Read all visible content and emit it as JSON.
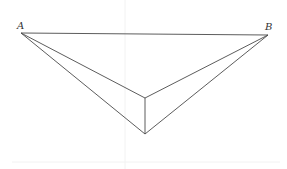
{
  "diagram": {
    "type": "geometry-figure",
    "labels": {
      "A": "A",
      "B": "B"
    },
    "points": [
      "A",
      "B",
      "C",
      "D"
    ],
    "segments": [
      [
        "A",
        "B"
      ],
      [
        "A",
        "C"
      ],
      [
        "A",
        "D"
      ],
      [
        "B",
        "C"
      ],
      [
        "B",
        "D"
      ],
      [
        "C",
        "D"
      ]
    ],
    "colors": {
      "line": "#4a4a4a",
      "label": "#333333",
      "background": "#ffffff"
    }
  }
}
